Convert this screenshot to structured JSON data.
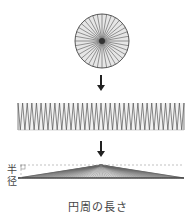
{
  "diagram": {
    "labels": {
      "radius": "半径",
      "circumference_length": "円周の長さ"
    },
    "circle": {
      "cx": 102,
      "cy": 41,
      "r": 27,
      "sectors": 36
    },
    "strip": {
      "x0": 18,
      "x1": 184,
      "y_top": 103,
      "y_bottom": 130,
      "teeth": 36
    },
    "triangle": {
      "base_left": 18,
      "base_right": 184,
      "base_y": 178,
      "apex_x": 101,
      "apex_y": 165,
      "rays": 72
    },
    "arrows": [
      {
        "x": 101,
        "y_from": 75,
        "y_to": 91
      },
      {
        "x": 101,
        "y_from": 141,
        "y_to": 157
      }
    ],
    "colors": {
      "stroke": "#555555",
      "fill": "#e6e6e6",
      "arrow": "#222222",
      "dashed": "#999999"
    }
  }
}
